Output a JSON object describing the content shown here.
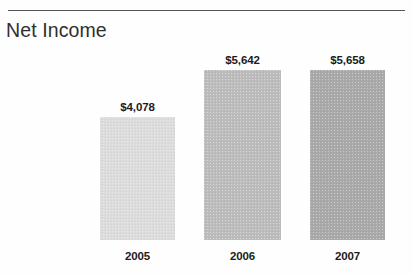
{
  "figure": {
    "title": "Net Income",
    "has_top_rule": true,
    "background_color": "#fefefe",
    "title_color": "#2f2f2f",
    "rule_color": "#3d3d3d"
  },
  "chart_data": {
    "type": "bar",
    "title": "Net Income",
    "subtitle": "",
    "xlabel": "",
    "ylabel": "",
    "categories": [
      "2005",
      "2006",
      "2007"
    ],
    "values": [
      4078,
      5642,
      5658
    ],
    "value_labels": [
      "$4,078",
      "$5,642",
      "$5,658"
    ],
    "bar_colors": [
      "#dcdcdc",
      "#bcbcbc",
      "#a9a9a9"
    ],
    "ylim": [
      0,
      6400
    ],
    "grid": false,
    "axis_visible": false,
    "legend": null,
    "annotations": []
  }
}
